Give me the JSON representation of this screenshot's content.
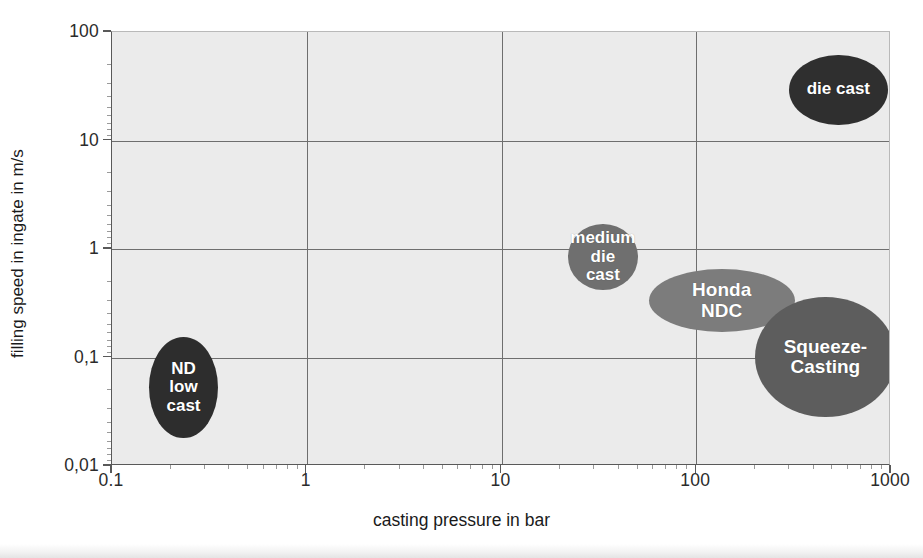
{
  "chart_data": {
    "type": "scatter",
    "title": "",
    "subtitle": "",
    "xlabel": "casting pressure in bar",
    "ylabel": "filling speed in ingate in m/s",
    "xscale": "log",
    "yscale": "log",
    "xlim": [
      0.1,
      1000
    ],
    "ylim": [
      0.01,
      100
    ],
    "xticks": [
      "0.1",
      "1",
      "10",
      "100",
      "1000"
    ],
    "xtick_values": [
      0.1,
      1,
      10,
      100,
      1000
    ],
    "yticks": [
      "100",
      "10",
      "1",
      "0,1",
      "0,01"
    ],
    "ytick_values": [
      100,
      10,
      1,
      0.1,
      0.01
    ],
    "grid": true,
    "legend": "none",
    "plot_background": "#ebebeb",
    "bubbles": [
      {
        "label": "ND low cast",
        "lines": [
          "ND",
          "low",
          "cast"
        ],
        "x": 0.23,
        "y": 0.055,
        "x_range": [
          0.155,
          0.35
        ],
        "y_range": [
          0.018,
          0.155
        ],
        "color": "#2d2d2d",
        "shape": "ellipse",
        "font_size": 17
      },
      {
        "label": "medium die cast",
        "lines": [
          "medium",
          "die",
          "cast"
        ],
        "x": 33,
        "y": 0.85,
        "x_range": [
          22,
          50
        ],
        "y_range": [
          0.42,
          1.7
        ],
        "color": "#6f6f6f",
        "shape": "ellipse",
        "font_size": 17
      },
      {
        "label": "die cast",
        "lines": [
          "die cast"
        ],
        "x": 540,
        "y": 30,
        "x_range": [
          300,
          960
        ],
        "y_range": [
          14,
          62
        ],
        "color": "#2f2f2f",
        "shape": "ellipse",
        "font_size": 17
      },
      {
        "label": "Honda NDC",
        "lines": [
          "Honda",
          "NDC"
        ],
        "x": 135,
        "y": 0.33,
        "x_range": [
          57,
          320
        ],
        "y_range": [
          0.17,
          0.65
        ],
        "color": "#7c7c7c",
        "shape": "ellipse",
        "font_size": 19
      },
      {
        "label": "Squeeze-Casting",
        "lines": [
          "Squeeze-",
          "Casting"
        ],
        "x": 460,
        "y": 0.1,
        "x_range": [
          200,
          1060
        ],
        "y_range": [
          0.028,
          0.36
        ],
        "color": "#5d5d5d",
        "shape": "ellipse",
        "font_size": 19
      }
    ]
  }
}
